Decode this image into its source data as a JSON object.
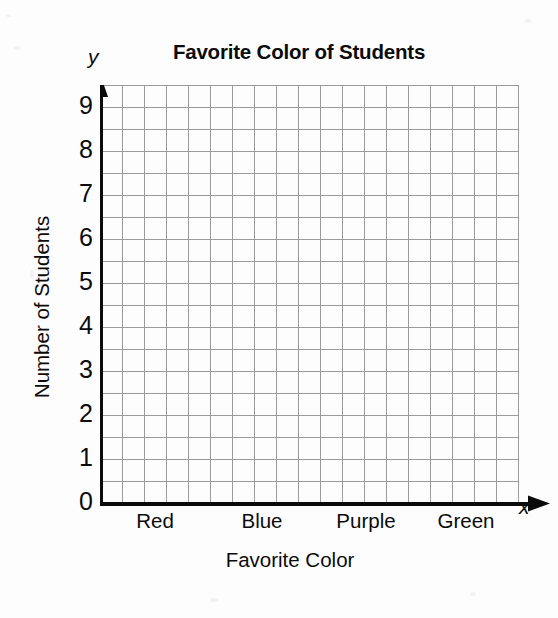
{
  "chart_data": {
    "type": "bar",
    "title": "Favorite Color of Students",
    "subtitle": "",
    "xlabel": "Favorite Color",
    "ylabel": "Number of Students",
    "categories": [
      "Red",
      "Blue",
      "Purple",
      "Green"
    ],
    "values": [
      null,
      null,
      null,
      null
    ],
    "series": [],
    "ylim": [
      0,
      9.5
    ],
    "y_ticks": [
      0,
      1,
      2,
      3,
      4,
      5,
      6,
      7,
      8,
      9
    ],
    "y_tick_labels": [
      "0",
      "1",
      "2",
      "3",
      "4",
      "5",
      "6",
      "7",
      "8",
      "9"
    ],
    "grid": true,
    "grid_columns": 19,
    "grid_rows": 19,
    "minor_divisions_per_unit": 2,
    "legend": false,
    "legend_position": "none",
    "annotations": [],
    "note": "Blank grid worksheet - no bars plotted; axes and grid only"
  },
  "axes": {
    "y_axis_letter": "y",
    "x_axis_letter": "x",
    "y_axis_title": "Number of Students",
    "x_axis_title": "Favorite Color"
  },
  "colors": {
    "background": "#fdfdfd",
    "axis": "#0b0b0b",
    "grid": "#9a9a9a",
    "grid_minor": "#b6b6b6",
    "text": "#0b0b0b"
  }
}
